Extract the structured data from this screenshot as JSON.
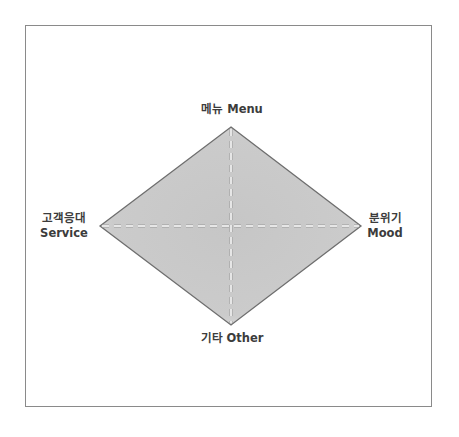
{
  "diagram": {
    "type": "diamond-quadrant",
    "colors": {
      "frame_border": "#8a8a8a",
      "fill": "#c9c9c9",
      "fill_edge": "#e2e2e2",
      "outline": "#6e6e6e",
      "axis_line": "#ffffff",
      "label_text": "#3c3c3c"
    },
    "vertices": {
      "top": {
        "ko": "메뉴",
        "en": "Menu"
      },
      "right": {
        "ko": "분위기",
        "en": "Mood"
      },
      "bottom": {
        "ko": "기타",
        "en": "Other"
      },
      "left": {
        "ko": "고객응대",
        "en": "Service"
      }
    }
  }
}
